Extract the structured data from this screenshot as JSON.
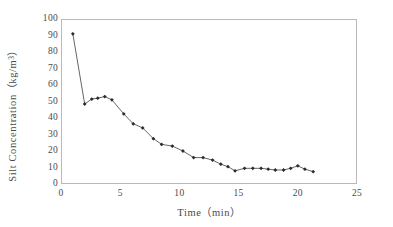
{
  "chart_data": {
    "type": "line",
    "title": "",
    "xlabel": "Time（min）",
    "ylabel_text": "Silt Concentration（kg/m",
    "ylabel_sup": "3",
    "ylabel_tail": "）",
    "ylabel_full": "Silt Concentration（kg/m3）",
    "xlim": [
      0,
      25
    ],
    "ylim": [
      0,
      100
    ],
    "xticks": [
      0,
      5,
      10,
      15,
      20,
      25
    ],
    "yticks": [
      0,
      10,
      20,
      30,
      40,
      50,
      60,
      70,
      80,
      90,
      100
    ],
    "grid": false,
    "legend": null,
    "series_name": "Silt concentration",
    "marker": "filled-diamond",
    "line_color": "#555555",
    "marker_color": "#2b2b2b",
    "frame_color": "#b9b9b9",
    "background": "#ffffff",
    "x": [
      1.0,
      2.0,
      2.6,
      3.1,
      3.7,
      4.3,
      5.3,
      6.1,
      6.9,
      7.8,
      8.5,
      9.4,
      10.3,
      11.2,
      12.0,
      12.8,
      13.5,
      14.1,
      14.7,
      15.5,
      16.2,
      16.9,
      17.5,
      18.1,
      18.8,
      19.4,
      20.0,
      20.6,
      21.3
    ],
    "values": [
      91.0,
      48.5,
      51.5,
      52.0,
      53.0,
      51.0,
      42.5,
      36.5,
      34.0,
      27.5,
      24.0,
      23.0,
      20.0,
      16.0,
      16.0,
      14.5,
      12.0,
      10.5,
      8.0,
      9.5,
      9.5,
      9.5,
      9.0,
      8.5,
      8.5,
      9.5,
      11.0,
      9.0,
      7.5
    ]
  }
}
